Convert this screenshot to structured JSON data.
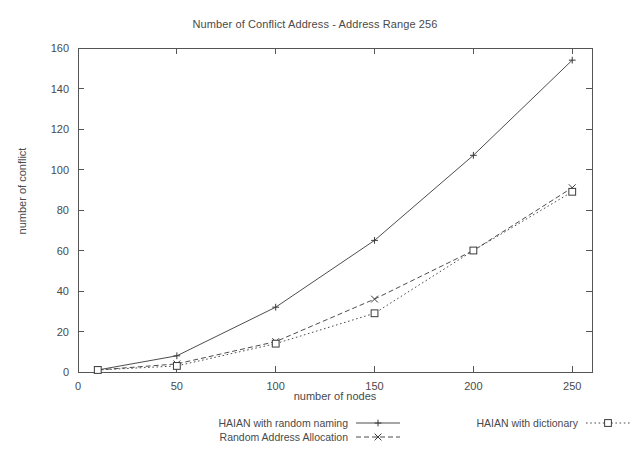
{
  "chart_data": {
    "type": "line",
    "title": "Number of Conflict Address - Address Range 256",
    "xlabel": "number of nodes",
    "ylabel": "number of conflict",
    "xlim": [
      0,
      260
    ],
    "ylim": [
      0,
      160
    ],
    "xticks": [
      "0",
      "50",
      "100",
      "150",
      "200",
      "250"
    ],
    "xtick_values": [
      0,
      50,
      100,
      150,
      200,
      250
    ],
    "yticks": [
      "0",
      "20",
      "40",
      "60",
      "80",
      "100",
      "120",
      "140",
      "160"
    ],
    "ytick_values": [
      0,
      20,
      40,
      60,
      80,
      100,
      120,
      140,
      160
    ],
    "grid": false,
    "legend_position": "below",
    "x": [
      10,
      50,
      100,
      150,
      200,
      250
    ],
    "series": [
      {
        "name": "HAIAN with random naming",
        "values": [
          1,
          8,
          32,
          65,
          107,
          154
        ],
        "linestyle": "solid",
        "marker": "plus",
        "color": "#4d4d4d"
      },
      {
        "name": "Random Address Allocation",
        "values": [
          1,
          4,
          15,
          36,
          60,
          91
        ],
        "linestyle": "dashed",
        "marker": "cross",
        "color": "#4d4d4d"
      },
      {
        "name": "HAIAN with dictionary",
        "values": [
          1,
          3,
          14,
          29,
          60,
          89
        ],
        "linestyle": "dotted",
        "marker": "square",
        "color": "#4d4d4d"
      }
    ]
  },
  "legend": {
    "entries": [
      {
        "label": "HAIAN with random naming",
        "style": "solid",
        "marker": "plus"
      },
      {
        "label": "Random Address Allocation",
        "style": "dashed",
        "marker": "cross"
      },
      {
        "label": "HAIAN with dictionary",
        "style": "dotted",
        "marker": "square"
      }
    ]
  }
}
